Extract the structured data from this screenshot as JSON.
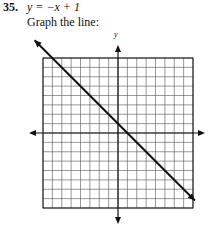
{
  "problem": {
    "number": "35.",
    "equation": "y = −x + 1",
    "instruction": "Graph the line:"
  },
  "graph": {
    "y_axis_label": "y",
    "grid": {
      "columns": 16,
      "rows": 16,
      "x_range": [
        -8,
        8
      ],
      "y_range": [
        -8,
        8
      ]
    },
    "line": {
      "slope": -1,
      "intercept": 1
    },
    "colors": {
      "grid": "#555555",
      "axis": "#111111",
      "line": "#111111"
    }
  }
}
